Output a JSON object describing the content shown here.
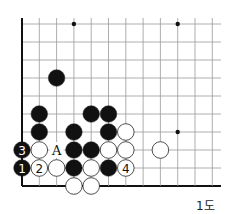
{
  "diagram": {
    "caption": "1도",
    "grid": {
      "x0": 22,
      "y0": 24,
      "dx": 17.3,
      "dy": 18,
      "cols": 12,
      "rows": 10,
      "right_extent": 221,
      "edges": [
        "left",
        "bottom"
      ]
    },
    "star_points": [
      [
        3,
        0
      ],
      [
        9,
        0
      ],
      [
        9,
        6
      ]
    ],
    "stones": [
      {
        "c": 2,
        "r": 3,
        "color": "black"
      },
      {
        "c": 1,
        "r": 5,
        "color": "black"
      },
      {
        "c": 4,
        "r": 5,
        "color": "black"
      },
      {
        "c": 5,
        "r": 5,
        "color": "black"
      },
      {
        "c": 1,
        "r": 6,
        "color": "black"
      },
      {
        "c": 3,
        "r": 6,
        "color": "black"
      },
      {
        "c": 5,
        "r": 6,
        "color": "black"
      },
      {
        "c": 6,
        "r": 6,
        "color": "white"
      },
      {
        "c": 0,
        "r": 7,
        "color": "black",
        "label": "3"
      },
      {
        "c": 1,
        "r": 7,
        "color": "white"
      },
      {
        "c": 3,
        "r": 7,
        "color": "black"
      },
      {
        "c": 4,
        "r": 7,
        "color": "black"
      },
      {
        "c": 5,
        "r": 7,
        "color": "white"
      },
      {
        "c": 6,
        "r": 7,
        "color": "white"
      },
      {
        "c": 8,
        "r": 7,
        "color": "white"
      },
      {
        "c": 0,
        "r": 8,
        "color": "black",
        "label": "1"
      },
      {
        "c": 1,
        "r": 8,
        "color": "white",
        "label": "2"
      },
      {
        "c": 2,
        "r": 8,
        "color": "white"
      },
      {
        "c": 3,
        "r": 8,
        "color": "black"
      },
      {
        "c": 4,
        "r": 8,
        "color": "white"
      },
      {
        "c": 5,
        "r": 8,
        "color": "black"
      },
      {
        "c": 6,
        "r": 8,
        "color": "white",
        "label": "4"
      },
      {
        "c": 3,
        "r": 9,
        "color": "white"
      },
      {
        "c": 4,
        "r": 9,
        "color": "white"
      }
    ],
    "markers": [
      {
        "c": 2,
        "r": 7,
        "label": "A"
      }
    ]
  }
}
